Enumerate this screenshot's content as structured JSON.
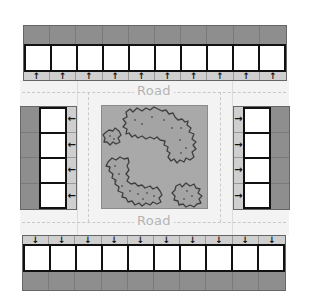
{
  "diagram": {
    "road_labels": {
      "top": "Road",
      "bottom": "Road"
    },
    "colors": {
      "stall_fill": "#ffffff",
      "stall_border": "#111111",
      "back_strip": "#8e8e8e",
      "arrow_strip": "#cfcfcf",
      "road": "#f3f3f3",
      "road_marking": "#c9c9c9",
      "road_label": "#b4b4b4",
      "park": "#a9a9a9",
      "tree_outline": "#444444"
    },
    "parking_rows": [
      {
        "id": "top",
        "orientation": "horizontal",
        "stalls": 10,
        "arrow": "↑"
      },
      {
        "id": "bottom",
        "orientation": "horizontal",
        "stalls": 10,
        "arrow": "↓"
      },
      {
        "id": "left",
        "orientation": "vertical",
        "stalls": 4,
        "arrow": "←"
      },
      {
        "id": "right",
        "orientation": "vertical",
        "stalls": 4,
        "arrow": "→"
      }
    ],
    "center": {
      "label": "park",
      "tree_clusters": 4
    }
  }
}
